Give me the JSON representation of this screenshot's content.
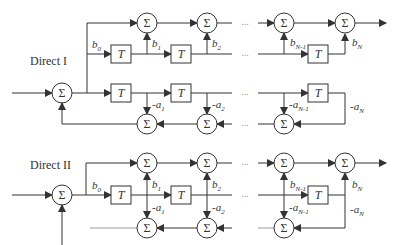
{
  "diagram": {
    "sections": [
      {
        "title": "Direct I",
        "adder_symbol": "Σ",
        "delay_label": "T",
        "ellipsis": "...",
        "feedforward_coefficients": [
          {
            "base": "b",
            "sub": "0"
          },
          {
            "base": "b",
            "sub": "1"
          },
          {
            "base": "b",
            "sub": "2"
          },
          {
            "base": "b",
            "sub": "N-1"
          },
          {
            "base": "b",
            "sub": "N"
          }
        ],
        "feedback_coefficients": [
          {
            "base": "-a",
            "sub": "1"
          },
          {
            "base": "-a",
            "sub": "2"
          },
          {
            "base": "-a",
            "sub": "N-1"
          },
          {
            "base": "-a",
            "sub": "N"
          }
        ]
      },
      {
        "title": "Direct II",
        "adder_symbol": "Σ",
        "delay_label": "T",
        "ellipsis": "...",
        "feedforward_coefficients": [
          {
            "base": "b",
            "sub": "0"
          },
          {
            "base": "b",
            "sub": "1"
          },
          {
            "base": "b",
            "sub": "2"
          },
          {
            "base": "b",
            "sub": "N-1"
          },
          {
            "base": "b",
            "sub": "N"
          }
        ],
        "feedback_coefficients": [
          {
            "base": "-a",
            "sub": "1"
          },
          {
            "base": "-a",
            "sub": "2"
          },
          {
            "base": "-a",
            "sub": "N-1"
          },
          {
            "base": "-a",
            "sub": "N"
          }
        ]
      }
    ]
  }
}
